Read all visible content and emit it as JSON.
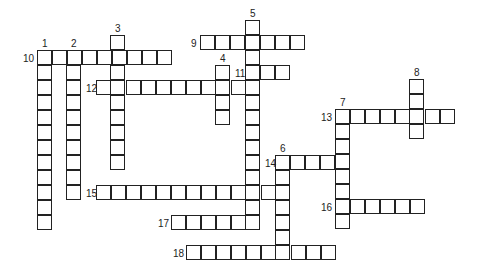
{
  "puzzle": {
    "cell_size": 15,
    "runs": [
      {
        "number": "1",
        "dir": "down",
        "x": 38,
        "y": 51,
        "length": 12
      },
      {
        "number": "2",
        "dir": "down",
        "x": 67,
        "y": 51,
        "length": 10
      },
      {
        "number": "3",
        "dir": "down",
        "x": 111,
        "y": 36,
        "length": 9
      },
      {
        "number": "4",
        "dir": "down",
        "x": 216,
        "y": 66,
        "length": 4
      },
      {
        "number": "5",
        "dir": "down",
        "x": 246,
        "y": 21,
        "length": 14
      },
      {
        "number": "6",
        "dir": "down",
        "x": 276,
        "y": 156,
        "length": 7
      },
      {
        "number": "7",
        "dir": "down",
        "x": 336,
        "y": 110,
        "length": 8
      },
      {
        "number": "8",
        "dir": "down",
        "x": 410,
        "y": 80,
        "length": 4
      },
      {
        "number": "9",
        "dir": "across",
        "x": 201,
        "y": 36,
        "length": 7
      },
      {
        "number": "10",
        "dir": "across",
        "x": 38,
        "y": 51,
        "length": 9
      },
      {
        "number": "11",
        "dir": "across",
        "x": 246,
        "y": 66,
        "length": 3
      },
      {
        "number": "12",
        "dir": "across",
        "x": 97,
        "y": 81,
        "length": 11
      },
      {
        "number": "13",
        "dir": "across",
        "x": 336,
        "y": 110,
        "length": 8
      },
      {
        "number": "14",
        "dir": "across",
        "x": 276,
        "y": 156,
        "length": 4
      },
      {
        "number": "15",
        "dir": "across",
        "x": 97,
        "y": 186,
        "length": 13
      },
      {
        "number": "16",
        "dir": "across",
        "x": 336,
        "y": 200,
        "length": 6
      },
      {
        "number": "17",
        "dir": "across",
        "x": 172,
        "y": 216,
        "length": 6
      },
      {
        "number": "18",
        "dir": "across",
        "x": 187,
        "y": 246,
        "length": 10
      }
    ],
    "labels": [
      {
        "text": "1",
        "x": 42,
        "y": 39
      },
      {
        "text": "2",
        "x": 71,
        "y": 39
      },
      {
        "text": "3",
        "x": 115,
        "y": 24
      },
      {
        "text": "4",
        "x": 220,
        "y": 54
      },
      {
        "text": "5",
        "x": 250,
        "y": 9
      },
      {
        "text": "6",
        "x": 280,
        "y": 144
      },
      {
        "text": "7",
        "x": 340,
        "y": 98
      },
      {
        "text": "8",
        "x": 414,
        "y": 68
      },
      {
        "text": "9",
        "x": 191,
        "y": 39
      },
      {
        "text": "10",
        "x": 23,
        "y": 54
      },
      {
        "text": "11",
        "x": 235,
        "y": 69
      },
      {
        "text": "12",
        "x": 86,
        "y": 84
      },
      {
        "text": "13",
        "x": 321,
        "y": 113
      },
      {
        "text": "14",
        "x": 265,
        "y": 159
      },
      {
        "text": "15",
        "x": 86,
        "y": 189
      },
      {
        "text": "16",
        "x": 321,
        "y": 203
      },
      {
        "text": "17",
        "x": 158,
        "y": 219
      },
      {
        "text": "18",
        "x": 173,
        "y": 249
      }
    ]
  }
}
